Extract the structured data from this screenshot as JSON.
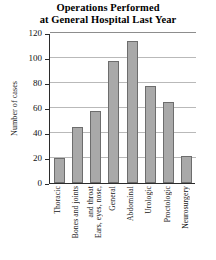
{
  "chart_data": {
    "type": "bar",
    "title": "Operations Performed at General Hospital Last Year",
    "title_lines": [
      "Operations Performed",
      "at General Hospital Last Year"
    ],
    "xlabel": "",
    "ylabel": "Number of cases",
    "categories": [
      "Thoracic",
      "Bones and joints",
      "Ears, eyes, nose, and throat",
      "General",
      "Abdominal",
      "Urologic",
      "Proctologic",
      "Neurosurgery"
    ],
    "category_lines": [
      [
        "Thoracic"
      ],
      [
        "Bones and joints"
      ],
      [
        "Ears, eyes, nose,",
        "and throat"
      ],
      [
        "General"
      ],
      [
        "Abdominal"
      ],
      [
        "Urologic"
      ],
      [
        "Proctologic"
      ],
      [
        "Neurosurgery"
      ]
    ],
    "values": [
      20,
      45,
      58,
      98,
      114,
      78,
      65,
      22
    ],
    "ylim": [
      0,
      120
    ],
    "yticks": [
      0,
      20,
      40,
      60,
      80,
      100,
      120
    ],
    "grid": true,
    "legend": false,
    "bar_color": "#a9a9a9",
    "bar_edge_color": "#6d6d6d",
    "grid_color": "#b9b9b9",
    "axis_color": "#2b2b2b"
  }
}
